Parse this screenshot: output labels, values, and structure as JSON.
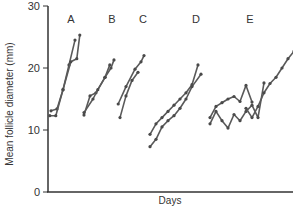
{
  "chart_data": {
    "type": "line",
    "title": "",
    "xlabel": "Days",
    "ylabel": "Mean follicle diameter (mm)",
    "ylim": [
      0,
      30
    ],
    "yticks": [
      0,
      10,
      20,
      30
    ],
    "xticks": [],
    "grid": false,
    "legend": null,
    "annotations": [
      "A",
      "B",
      "C",
      "D",
      "E"
    ],
    "groups": [
      {
        "label": "A",
        "label_x": 5,
        "series": [
          {
            "x": [
              0.5,
              1.5,
              2.5,
              3.5,
              4.5
            ],
            "y": [
              13.1,
              13.4,
              16.5,
              20.5,
              24.5
            ]
          },
          {
            "x": [
              0.3,
              1.3,
              2.5,
              3.8,
              4.8,
              5.3
            ],
            "y": [
              12.3,
              12.3,
              16.5,
              21.0,
              21.5,
              25.3
            ]
          }
        ]
      },
      {
        "label": "B",
        "label_x": 11,
        "series": [
          {
            "x": [
              6.0,
              7.0,
              8.0,
              9.5,
              10.5,
              11.0
            ],
            "y": [
              12.4,
              15.5,
              16.0,
              18.5,
              20.0,
              21.3
            ]
          },
          {
            "x": [
              6.0,
              7.5,
              8.3,
              9.5,
              10.3
            ],
            "y": [
              12.8,
              15.0,
              16.5,
              18.5,
              20.5
            ]
          }
        ]
      },
      {
        "label": "C",
        "label_x": 16,
        "series": [
          {
            "x": [
              11.7,
              13.0,
              14.5,
              15.5,
              16.0
            ],
            "y": [
              14.2,
              17.0,
              19.8,
              21.0,
              22.0
            ]
          },
          {
            "x": [
              12.0,
              13.0,
              14.0,
              15.0
            ],
            "y": [
              12.0,
              15.5,
              18.0,
              19.3
            ]
          }
        ]
      },
      {
        "label": "D",
        "label_x": 23,
        "series": [
          {
            "x": [
              17.0,
              18.0,
              19.0,
              20.0,
              21.0,
              22.0,
              23.0,
              24.0,
              25.0
            ],
            "y": [
              9.3,
              11.0,
              12.0,
              13.0,
              14.0,
              15.0,
              16.0,
              17.3,
              20.5
            ]
          },
          {
            "x": [
              17.0,
              18.0,
              19.0,
              20.0,
              21.0,
              22.0,
              23.0,
              24.0,
              25.5
            ],
            "y": [
              7.3,
              8.5,
              10.5,
              11.5,
              12.3,
              13.5,
              15.0,
              17.0,
              19.0
            ]
          }
        ]
      },
      {
        "label": "E",
        "label_x": 31,
        "series": [
          {
            "x": [
              27.0,
              28.0,
              29.0,
              30.0,
              31.0,
              32.0,
              33.0,
              34.0
            ],
            "y": [
              12.0,
              13.8,
              14.4,
              15.0,
              15.4,
              14.6,
              17.2,
              14.5
            ]
          },
          {
            "x": [
              27.0,
              28.0,
              29.0,
              30.0,
              31.0,
              32.0,
              33.0,
              34.0,
              35.0,
              36.0
            ],
            "y": [
              11.0,
              13.0,
              11.5,
              10.3,
              12.5,
              11.5,
              13.0,
              14.0,
              12.0,
              17.6
            ]
          },
          {
            "x": [
              33.0,
              34.0,
              35.0,
              36.0,
              37.0,
              38.0,
              39.0,
              40.0,
              41.0,
              41.5
            ],
            "y": [
              13.5,
              12.0,
              13.8,
              16.0,
              17.5,
              18.5,
              20.0,
              21.5,
              22.7,
              23.0
            ]
          },
          {
            "x": [
              41.8
            ],
            "y": [
              21.8
            ]
          }
        ]
      }
    ]
  },
  "axes": {
    "xlabel": "Days",
    "ylabel": "Mean follicle diameter (mm)",
    "ytick_labels": [
      "0",
      "10",
      "20",
      "30"
    ]
  },
  "group_labels": [
    "A",
    "B",
    "C",
    "D",
    "E"
  ],
  "colors": {
    "line": "#5a5a5a",
    "marker": "#4a4a4a",
    "axis": "#333333",
    "text": "#333333"
  }
}
